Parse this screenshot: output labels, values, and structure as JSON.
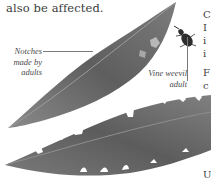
{
  "document": {
    "body_text": "also be affected.",
    "captions": {
      "notches": "Notches made by adults",
      "weevil": "Vine weevil adult"
    },
    "right_column_fragments": [
      "C",
      "I",
      "i",
      "i",
      "F",
      "c",
      "U"
    ],
    "illustration": {
      "subject": "two leaves with notched edges and a vine weevil beetle",
      "leaf_color": "#6f6f6f",
      "leaf_dark": "#4e4e4e",
      "leaf_light": "#9a9a9a",
      "beetle_color": "#2e2e2e"
    }
  }
}
